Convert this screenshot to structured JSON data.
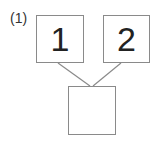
{
  "problem": {
    "label": "(1)",
    "top_boxes": [
      {
        "value": "1"
      },
      {
        "value": "2"
      }
    ],
    "result_box": {
      "value": ""
    }
  },
  "colors": {
    "border": "#8a8a8a",
    "text": "#222222",
    "connector": "#8a8a8a"
  }
}
